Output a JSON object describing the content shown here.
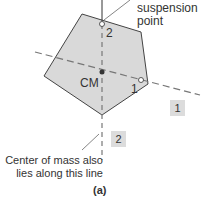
{
  "labels": {
    "suspension": [
      "suspension",
      "point"
    ],
    "cm": "CM",
    "point1": "1",
    "point2": "2",
    "line1_tag": "1",
    "line2_tag": "2",
    "caption": [
      "Center of mass also",
      "lies along this line"
    ],
    "figure_label": "(a)"
  },
  "colors": {
    "shape_fill": "#d9d9d9",
    "shape_stroke": "#444444",
    "dashed_line": "#777777",
    "tag_bg": "#dcdcdc"
  }
}
